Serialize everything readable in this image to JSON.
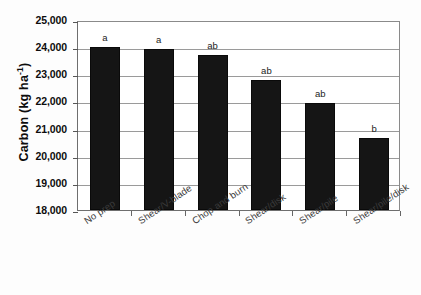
{
  "chart_data": {
    "type": "bar",
    "title": "",
    "xlabel": "",
    "ylabel": "Carbon (kg ha-1)",
    "ylabel_base": "Carbon (kg ha",
    "ylabel_sup": "-1",
    "ylabel_tail": ")",
    "categories": [
      "No prep",
      "Shear/V-blade",
      "Chop and burn",
      "Shear/disk",
      "Shear/pile",
      "Shear/pile/disk"
    ],
    "values": [
      24000,
      23950,
      23700,
      22780,
      21950,
      20660
    ],
    "annotations": [
      "a",
      "a",
      "ab",
      "ab",
      "ab",
      "b"
    ],
    "ylim": [
      18000,
      25000
    ],
    "ytick_values": [
      25000,
      24000,
      23000,
      22000,
      21000,
      20000,
      19000,
      18000
    ],
    "ytick_labels": [
      "25,000",
      "24,000",
      "23,000",
      "22,000",
      "21,000",
      "20,000",
      "19,000",
      "18,000"
    ],
    "grid": true,
    "legend": "none",
    "bar_color": "#151515",
    "axis_color": "#6e6e6e",
    "grid_color": "#9a9a9a"
  }
}
